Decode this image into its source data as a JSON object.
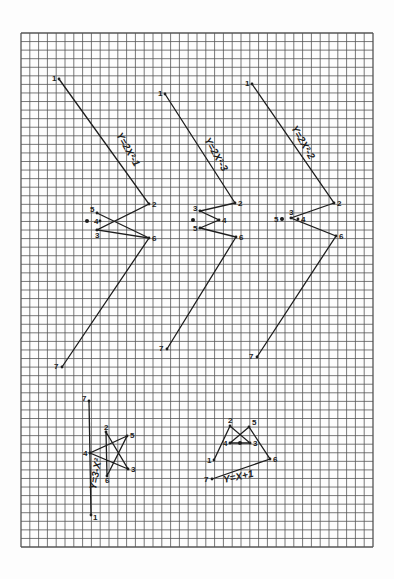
{
  "sheet": {
    "background": "#fdfdfd",
    "grid": {
      "x": 21,
      "y": 33,
      "width": 352,
      "height": 514,
      "cols": 40,
      "rows": 60,
      "color": "#555555"
    },
    "ink": "#1e1e1e"
  },
  "graphs": [
    {
      "id": "g1",
      "equation": "Y=2X²-1",
      "label_pos": {
        "x": 116,
        "y": 135,
        "angle": 60
      },
      "points": [
        {
          "n": "1",
          "x": 59,
          "y": 79,
          "lx": -7,
          "ly": 2
        },
        {
          "n": "2",
          "x": 149,
          "y": 204,
          "lx": 3,
          "ly": 3
        },
        {
          "n": "3",
          "x": 97,
          "y": 230,
          "lx": -2,
          "ly": 8
        },
        {
          "n": "4",
          "x": 100,
          "y": 221,
          "lx": -6,
          "ly": 3
        },
        {
          "n": "5",
          "x": 97,
          "y": 213,
          "lx": -7,
          "ly": -1
        },
        {
          "n": "6",
          "x": 149,
          "y": 238,
          "lx": 3,
          "ly": 3
        },
        {
          "n": "7",
          "x": 62,
          "y": 367,
          "lx": -8,
          "ly": 2
        }
      ],
      "dot": {
        "x": 87,
        "y": 221
      },
      "path": [
        [
          59,
          79
        ],
        [
          149,
          204
        ],
        [
          97,
          230
        ],
        [
          149,
          238
        ],
        [
          62,
          367
        ]
      ],
      "extra_path": [
        [
          97,
          213
        ],
        [
          149,
          238
        ]
      ]
    },
    {
      "id": "g2",
      "equation": "Y=2X²-3",
      "label_pos": {
        "x": 204,
        "y": 140,
        "angle": 60
      },
      "points": [
        {
          "n": "1",
          "x": 165,
          "y": 94,
          "lx": -7,
          "ly": 2
        },
        {
          "n": "2",
          "x": 235,
          "y": 203,
          "lx": 3,
          "ly": 3
        },
        {
          "n": "3",
          "x": 200,
          "y": 211,
          "lx": -7,
          "ly": 0
        },
        {
          "n": "4",
          "x": 219,
          "y": 220,
          "lx": 3,
          "ly": 3
        },
        {
          "n": "5",
          "x": 200,
          "y": 228,
          "lx": -7,
          "ly": 3
        },
        {
          "n": "6",
          "x": 236,
          "y": 237,
          "lx": 3,
          "ly": 3
        },
        {
          "n": "7",
          "x": 167,
          "y": 349,
          "lx": -8,
          "ly": 2
        }
      ],
      "dot": {
        "x": 193,
        "y": 220
      },
      "path": [
        [
          165,
          94
        ],
        [
          235,
          203
        ],
        [
          200,
          211
        ],
        [
          219,
          220
        ],
        [
          200,
          228
        ],
        [
          236,
          237
        ],
        [
          167,
          349
        ]
      ]
    },
    {
      "id": "g3",
      "equation": "Y=2X²-2",
      "label_pos": {
        "x": 291,
        "y": 128,
        "angle": 60
      },
      "points": [
        {
          "n": "1",
          "x": 252,
          "y": 84,
          "lx": -7,
          "ly": 2
        },
        {
          "n": "2",
          "x": 334,
          "y": 203,
          "lx": 3,
          "ly": 3
        },
        {
          "n": "3",
          "x": 291,
          "y": 218,
          "lx": -2,
          "ly": -3
        },
        {
          "n": "4",
          "x": 298,
          "y": 219,
          "lx": 3,
          "ly": 3
        },
        {
          "n": "5",
          "x": 282,
          "y": 219,
          "lx": -8,
          "ly": 3
        },
        {
          "n": "6",
          "x": 336,
          "y": 236,
          "lx": 3,
          "ly": 3
        },
        {
          "n": "7",
          "x": 257,
          "y": 357,
          "lx": -8,
          "ly": 2
        }
      ],
      "dot": {
        "x": 282,
        "y": 219
      },
      "path": [
        [
          252,
          84
        ],
        [
          334,
          203
        ],
        [
          291,
          218
        ],
        [
          336,
          236
        ],
        [
          257,
          357
        ]
      ]
    },
    {
      "id": "g4",
      "equation": "Y=3-X²",
      "label_pos": {
        "x": 96,
        "y": 490,
        "angle": -80
      },
      "points": [
        {
          "n": "1",
          "x": 91,
          "y": 515,
          "lx": 2,
          "ly": 5
        },
        {
          "n": "2",
          "x": 106,
          "y": 432,
          "lx": -2,
          "ly": -2
        },
        {
          "n": "3",
          "x": 128,
          "y": 469,
          "lx": 3,
          "ly": 3
        },
        {
          "n": "4",
          "x": 90,
          "y": 453,
          "lx": -7,
          "ly": 3
        },
        {
          "n": "5",
          "x": 127,
          "y": 436,
          "lx": 3,
          "ly": 2
        },
        {
          "n": "6",
          "x": 107,
          "y": 476,
          "lx": -2,
          "ly": 7
        },
        {
          "n": "7",
          "x": 89,
          "y": 401,
          "lx": -7,
          "ly": 0
        }
      ],
      "path": [
        [
          89,
          401
        ],
        [
          91,
          515
        ]
      ],
      "star": [
        [
          106,
          432
        ],
        [
          128,
          469
        ],
        [
          90,
          453
        ],
        [
          127,
          436
        ],
        [
          107,
          476
        ],
        [
          106,
          432
        ]
      ]
    },
    {
      "id": "g5",
      "equation": "Y=X+1",
      "label_pos": {
        "x": 224,
        "y": 483,
        "angle": -12
      },
      "points": [
        {
          "n": "1",
          "x": 214,
          "y": 460,
          "lx": -7,
          "ly": 3
        },
        {
          "n": "2",
          "x": 230,
          "y": 426,
          "lx": -2,
          "ly": -3
        },
        {
          "n": "3",
          "x": 250,
          "y": 443,
          "lx": 3,
          "ly": 3
        },
        {
          "n": "4",
          "x": 230,
          "y": 443,
          "lx": -7,
          "ly": 3
        },
        {
          "n": "5",
          "x": 249,
          "y": 427,
          "lx": 3,
          "ly": -2
        },
        {
          "n": "6",
          "x": 270,
          "y": 459,
          "lx": 3,
          "ly": 3
        },
        {
          "n": "7",
          "x": 212,
          "y": 479,
          "lx": -8,
          "ly": 3
        }
      ],
      "dot": {
        "x": 240,
        "y": 443
      },
      "path": [
        [
          214,
          460
        ],
        [
          230,
          426
        ],
        [
          250,
          443
        ],
        [
          230,
          443
        ],
        [
          249,
          427
        ],
        [
          270,
          459
        ],
        [
          212,
          479
        ]
      ]
    }
  ]
}
